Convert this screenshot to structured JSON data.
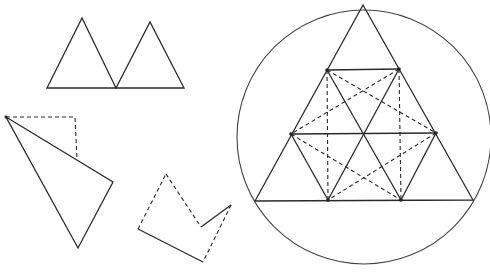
{
  "diagram": {
    "title": "",
    "colors": {
      "stroke": "#2a2a2a",
      "background": "#ffffff"
    },
    "figures": [
      {
        "id": "two-triangles",
        "description": "Two adjacent triangles sharing a base vertex",
        "triangles": [
          [
            [
              47,
              88
            ],
            [
              82,
              18
            ],
            [
              116,
              88
            ]
          ],
          [
            [
              116,
              88
            ],
            [
              150,
              22
            ],
            [
              184,
              88
            ]
          ]
        ]
      },
      {
        "id": "folded-triangle",
        "description": "Triangle with dashed rectangular corner outline",
        "solid": [
          [
            6,
            117
          ],
          [
            113,
            182
          ],
          [
            78,
            248
          ],
          [
            6,
            117
          ]
        ],
        "dashed": [
          [
            6,
            117
          ],
          [
            75,
            117
          ],
          [
            77,
            160
          ]
        ]
      },
      {
        "id": "notched-pentagon",
        "description": "Pentagon with notch; partly dashed edges",
        "solid_edges": [
          [
            [
              138,
              229
            ],
            [
              203,
              262
            ]
          ],
          [
            [
              201,
              227
            ],
            [
              231,
              205
            ]
          ]
        ],
        "dashed_edges": [
          [
            [
              138,
              229
            ],
            [
              166,
              174
            ]
          ],
          [
            [
              166,
              174
            ],
            [
              201,
              227
            ]
          ],
          [
            [
              231,
              205
            ],
            [
              203,
              262
            ]
          ]
        ]
      },
      {
        "id": "inscribed-triangle-grid",
        "description": "Equilateral triangle inscribed in circle, subdivided into triangular grid with dashed diagonals",
        "circle": {
          "cx": 364,
          "cy": 137,
          "r": 127
        },
        "outer_triangle": [
          [
            363,
            5
          ],
          [
            255,
            201
          ],
          [
            473,
            200
          ]
        ],
        "points": {
          "A": [
            327,
            70
          ],
          "B": [
            399,
            69
          ],
          "C": [
            291,
            134
          ],
          "D": [
            364,
            134
          ],
          "E": [
            436,
            133
          ],
          "F": [
            328,
            200
          ],
          "G": [
            401,
            200
          ]
        },
        "solid_lines": [
          [
            "A",
            "B"
          ],
          [
            "C",
            "E"
          ],
          [
            "A",
            "G"
          ],
          [
            "B",
            "F"
          ],
          [
            "C",
            "F"
          ],
          [
            "E",
            "G"
          ]
        ],
        "dashed_lines": [
          [
            "A",
            "F"
          ],
          [
            "B",
            "G"
          ],
          [
            "A",
            "E"
          ],
          [
            "B",
            "C"
          ],
          [
            "C",
            "G"
          ],
          [
            "E",
            "F"
          ]
        ]
      }
    ]
  }
}
